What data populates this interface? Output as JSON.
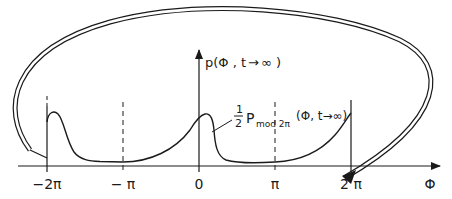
{
  "diagram": {
    "axes": {
      "x_label": "Φ",
      "y_label": "p(Φ,t→∞)",
      "x_ticks": [
        {
          "label": "−2π",
          "x": 47
        },
        {
          "label": "− π",
          "x": 123
        },
        {
          "label": "0",
          "x": 199
        },
        {
          "label": "π",
          "x": 275
        },
        {
          "label": "2 π",
          "x": 351
        }
      ]
    },
    "curve_label": {
      "fraction": "1",
      "denominator": "2",
      "main": "P",
      "subscript": "mod 2π",
      "args": "(Φ, t→∞)"
    },
    "y_axis_label_parts": {
      "prefix": "p(Φ , t",
      "arrow": "→",
      "suffix": "∞ )"
    },
    "colors": {
      "ink": "#1a1a1a",
      "background": "#ffffff"
    }
  }
}
